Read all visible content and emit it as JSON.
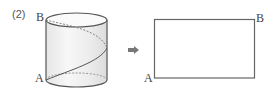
{
  "problem": {
    "number": "(2)"
  },
  "cylinder": {
    "label_top": "B",
    "label_bottom": "A"
  },
  "arrow": {
    "icon": "right-arrow-icon"
  },
  "rectangle": {
    "label_top_right": "B",
    "label_bottom_left": "A"
  },
  "colors": {
    "stroke": "#555555",
    "dashed": "#777777",
    "fill_light": "#f2f2f2",
    "arrow": "#777777"
  }
}
